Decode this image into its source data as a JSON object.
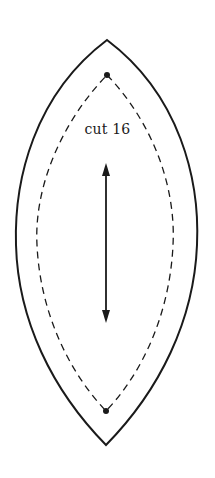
{
  "pattern_piece": {
    "instruction": "cut 16",
    "shape": "lens / vesica (pointed oval)",
    "outline": "solid cutting line",
    "seam_line": "dashed stitching line",
    "markers": [
      "top-dot",
      "bottom-dot"
    ],
    "grainline": "double-headed vertical arrow"
  },
  "colors": {
    "line": "#1a1a1a",
    "background": "#ffffff"
  }
}
